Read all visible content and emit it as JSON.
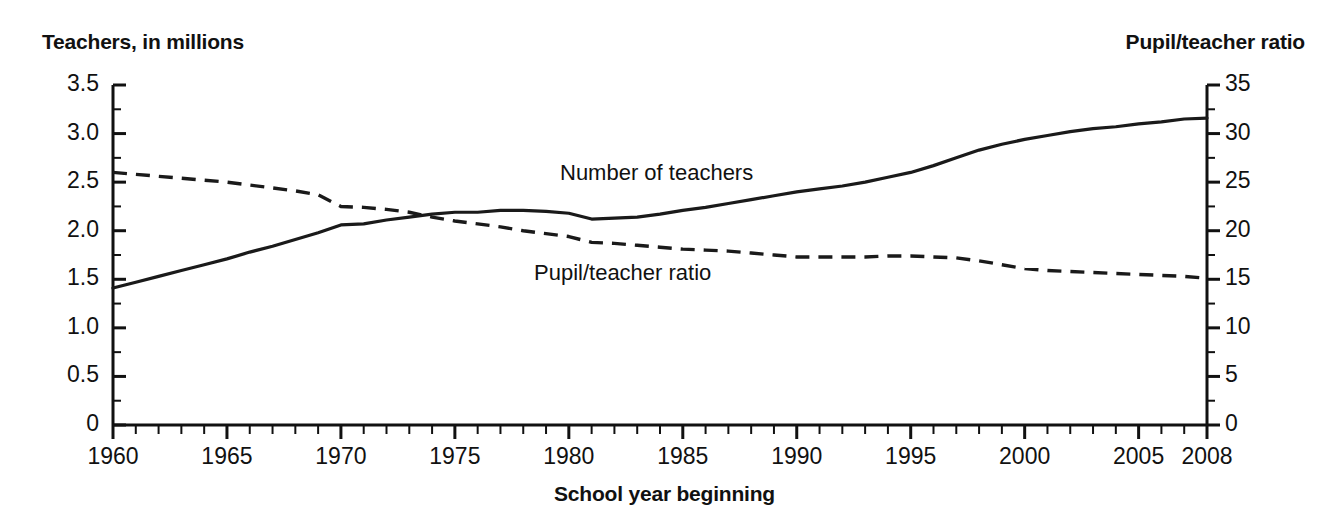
{
  "chart_data": {
    "type": "line",
    "title": "",
    "xlabel": "School year beginning",
    "left_axis": {
      "label": "Teachers, in millions",
      "ylim": [
        0,
        3.5
      ],
      "ticks": [
        "0",
        "0.5",
        "1.0",
        "1.5",
        "2.0",
        "2.5",
        "3.0",
        "3.5"
      ],
      "tick_values": [
        0,
        0.5,
        1.0,
        1.5,
        2.0,
        2.5,
        3.0,
        3.5
      ],
      "minor_step": 0.25
    },
    "right_axis": {
      "label": "Pupil/teacher ratio",
      "ylim": [
        0,
        35
      ],
      "ticks": [
        "0",
        "5",
        "10",
        "15",
        "20",
        "25",
        "30",
        "35"
      ],
      "tick_values": [
        0,
        5,
        10,
        15,
        20,
        25,
        30,
        35
      ],
      "minor_step": 2.5
    },
    "xlim": [
      1960,
      2008
    ],
    "xticks": [
      "1960",
      "1965",
      "1970",
      "1975",
      "1980",
      "1985",
      "1990",
      "1995",
      "2000",
      "2005",
      "2008"
    ],
    "xtick_values": [
      1960,
      1965,
      1970,
      1975,
      1980,
      1985,
      1990,
      1995,
      2000,
      2005,
      2008
    ],
    "x_minor_step": 1,
    "grid": false,
    "legend_position": "inline-annotation",
    "x": [
      1960,
      1961,
      1962,
      1963,
      1964,
      1965,
      1966,
      1967,
      1968,
      1969,
      1970,
      1971,
      1972,
      1973,
      1974,
      1975,
      1976,
      1977,
      1978,
      1979,
      1980,
      1981,
      1982,
      1983,
      1984,
      1985,
      1986,
      1987,
      1988,
      1989,
      1990,
      1991,
      1992,
      1993,
      1994,
      1995,
      1996,
      1997,
      1998,
      1999,
      2000,
      2001,
      2002,
      2003,
      2004,
      2005,
      2006,
      2007,
      2008
    ],
    "series": [
      {
        "name": "Number of teachers",
        "axis": "left",
        "style": "solid",
        "unit": "millions",
        "values": [
          1.41,
          1.47,
          1.53,
          1.59,
          1.65,
          1.71,
          1.78,
          1.84,
          1.91,
          1.98,
          2.06,
          2.07,
          2.11,
          2.14,
          2.17,
          2.19,
          2.19,
          2.21,
          2.21,
          2.2,
          2.18,
          2.12,
          2.13,
          2.14,
          2.17,
          2.21,
          2.24,
          2.28,
          2.32,
          2.36,
          2.4,
          2.43,
          2.46,
          2.5,
          2.55,
          2.6,
          2.67,
          2.75,
          2.83,
          2.89,
          2.94,
          2.98,
          3.02,
          3.05,
          3.07,
          3.1,
          3.12,
          3.15,
          3.16
        ]
      },
      {
        "name": "Pupil/teacher ratio",
        "axis": "right",
        "style": "dashed",
        "unit": "pupils per teacher",
        "values": [
          26.0,
          25.8,
          25.6,
          25.4,
          25.2,
          25.0,
          24.7,
          24.4,
          24.1,
          23.7,
          22.5,
          22.4,
          22.2,
          21.9,
          21.4,
          21.0,
          20.7,
          20.4,
          20.0,
          19.7,
          19.4,
          18.8,
          18.7,
          18.5,
          18.3,
          18.1,
          18.0,
          17.9,
          17.7,
          17.5,
          17.3,
          17.3,
          17.3,
          17.3,
          17.4,
          17.4,
          17.3,
          17.2,
          16.9,
          16.5,
          16.1,
          15.9,
          15.8,
          15.7,
          15.6,
          15.5,
          15.4,
          15.3,
          15.1
        ]
      }
    ]
  }
}
